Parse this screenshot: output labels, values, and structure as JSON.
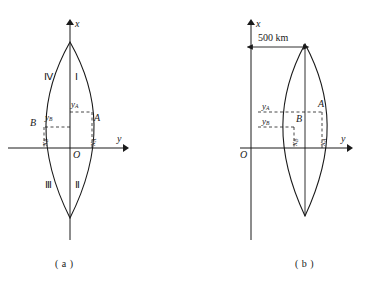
{
  "figure": {
    "title_a_caption": "( a )",
    "title_b_caption": "( b )"
  },
  "panel_a": {
    "name": "lens-diagram-centered",
    "axis_x_label": "x",
    "axis_y_label": "y",
    "origin_label": "O",
    "quadrants": [
      {
        "id": "I",
        "label": "Ⅰ"
      },
      {
        "id": "II",
        "label": "Ⅱ"
      },
      {
        "id": "III",
        "label": "Ⅲ"
      },
      {
        "id": "IV",
        "label": "Ⅳ"
      }
    ],
    "points": [
      {
        "id": "A",
        "label": "A"
      },
      {
        "id": "B",
        "label": "B"
      }
    ],
    "coord_labels": {
      "y_A": "y",
      "y_A_sub": "A",
      "y_B": "y",
      "y_B_sub": "B",
      "x_A": "x",
      "x_A_sub": "A",
      "x_B": "x",
      "x_B_sub": "B"
    }
  },
  "panel_b": {
    "name": "lens-diagram-offset",
    "axis_x_label": "x",
    "axis_y_label": "y",
    "origin_label": "O",
    "dimension_label": "500 km",
    "points": [
      {
        "id": "A",
        "label": "A"
      },
      {
        "id": "B",
        "label": "B"
      }
    ],
    "coord_labels": {
      "y_A": "y",
      "y_A_sub": "A",
      "y_B": "y",
      "y_B_sub": "B",
      "x_A": "x",
      "x_A_sub": "A",
      "x_B": "x",
      "x_B_sub": "B"
    }
  },
  "colors": {
    "stroke": "#1a1a1a",
    "background": "#ffffff"
  }
}
